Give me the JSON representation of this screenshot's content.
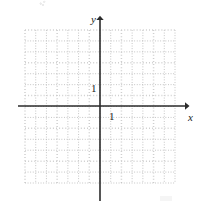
{
  "figure": {
    "kind": "cartesian-coordinate-grid",
    "background_color": "#ffffff",
    "width": 200,
    "height": 208
  },
  "axes": {
    "x_label": "x",
    "y_label": "y",
    "axis_color": "#2b2b2b",
    "x_axis_y_px": 106,
    "y_axis_x_px": 100,
    "x_axis_start_px": 18,
    "x_axis_end_px": 189,
    "y_axis_start_px": 16,
    "y_axis_end_px": 201,
    "x_arrow_direction": "right",
    "y_arrow_direction": "up"
  },
  "tick_labels": {
    "y_unit": "1",
    "x_unit": "1"
  },
  "grid": {
    "style": "dotted",
    "color": "#b9b9b9",
    "major_color": "#cfcfcf",
    "spacing_px": 10.8,
    "left_px": 25,
    "top_px": 30,
    "right_px": 175,
    "bottom_px": 183,
    "columns": 14,
    "rows": 14,
    "major_every": 3
  },
  "chart_data": {
    "type": "scatter",
    "title": "",
    "xlabel": "x",
    "ylabel": "y",
    "x": [],
    "y": [],
    "series": [],
    "xlim": [
      -7,
      7
    ],
    "ylim": [
      -7,
      7
    ],
    "xticks": [
      1
    ],
    "yticks": [
      1
    ],
    "xtick_labels": [
      "1"
    ],
    "ytick_labels": [
      "1"
    ],
    "grid": true,
    "legend": "none",
    "annotations": [],
    "note": "Blank Cartesian grid template with labeled unit ticks; no data plotted."
  }
}
